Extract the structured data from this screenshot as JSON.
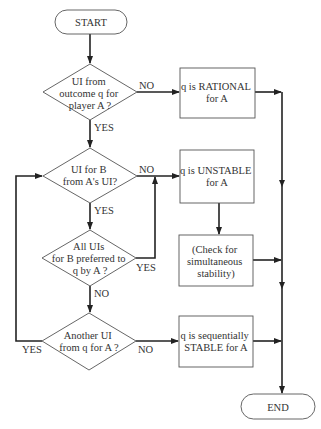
{
  "diagram": {
    "type": "flowchart",
    "nodes": {
      "start": {
        "label": "START"
      },
      "d1": {
        "lines": [
          "UI from",
          "outcome q for",
          "player A ?"
        ]
      },
      "rational": {
        "lines": [
          "q is RATIONAL",
          "for A"
        ]
      },
      "d2": {
        "lines": [
          "UI for B",
          "from A's UI?"
        ]
      },
      "unstable": {
        "lines": [
          "q is UNSTABLE",
          "for A"
        ]
      },
      "d3": {
        "lines": [
          "All UIs",
          "for B preferred to",
          "q by A ?"
        ]
      },
      "check": {
        "lines": [
          "(Check for",
          "simultaneous",
          "stability)"
        ]
      },
      "d4": {
        "lines": [
          "Another UI",
          "from q for A ?"
        ]
      },
      "seq": {
        "lines": [
          "q is sequentially",
          "STABLE for A"
        ]
      },
      "end": {
        "label": "END"
      }
    },
    "edge_labels": {
      "d1_no": "NO",
      "d1_yes": "YES",
      "d2_no": "NO",
      "d2_yes": "YES",
      "d3_yes": "YES",
      "d3_no": "NO",
      "d4_yes": "YES",
      "d4_no": "NO"
    },
    "colors": {
      "stroke": "#222222",
      "shape_border": "#555555",
      "text": "#333333",
      "background": "#ffffff"
    }
  }
}
